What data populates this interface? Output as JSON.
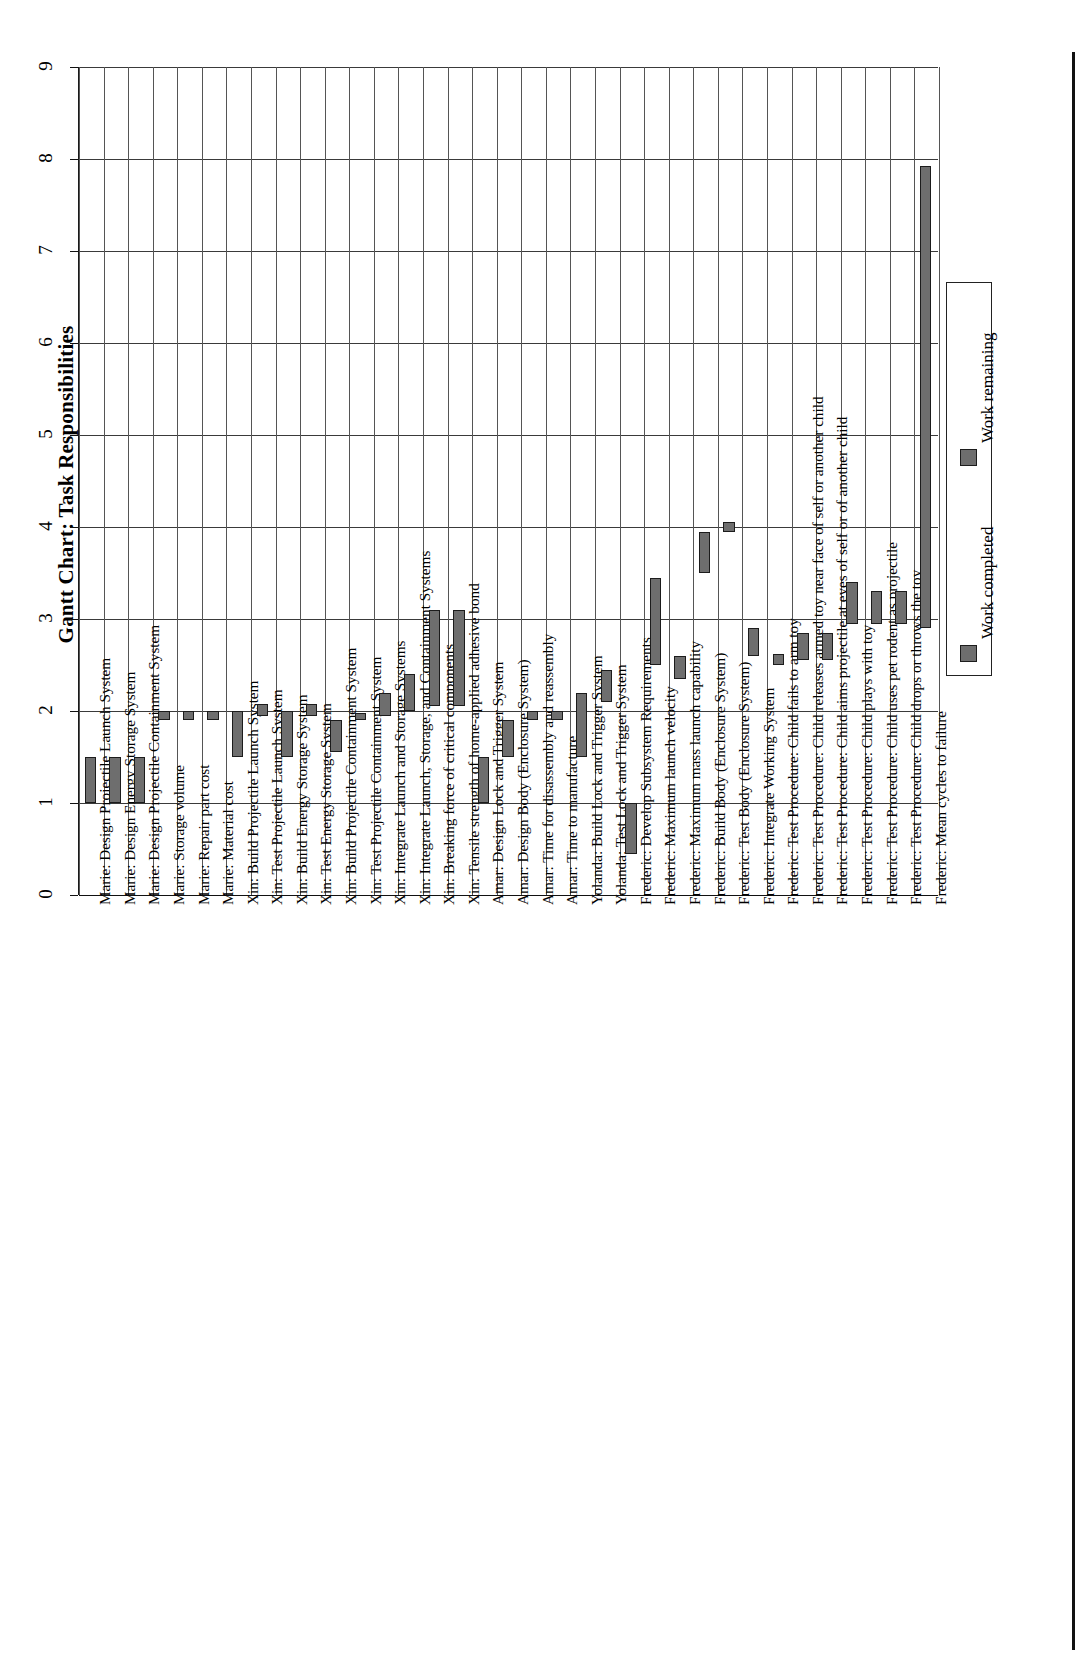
{
  "chart_data": {
    "type": "bar",
    "subtype": "gantt-floating-bar",
    "title": "Gantt Chart: Task Responsibilities",
    "xlabel": "",
    "ylabel": "",
    "ylim": [
      0,
      9
    ],
    "yticks": [
      0,
      1,
      2,
      3,
      4,
      5,
      6,
      7,
      8,
      9
    ],
    "grid": true,
    "orientation": "rotated-90",
    "legend": {
      "position": "right",
      "entries": [
        {
          "label": "Work completed",
          "color": "#6e6e6e"
        },
        {
          "label": "Work remaining",
          "color": "#6e6e6e"
        }
      ]
    },
    "categories": [
      "Marie: Design Projectile Launch System",
      "Marie: Design Energy Storage System",
      "Marie: Design Projectile Containment System",
      "Marie: Storage volume",
      "Marie: Repair part cost",
      "Marie: Material cost",
      "Xin: Build Projectile Launch System",
      "Xin: Test Projectile Launch System",
      "Xin: Build Energy Storage System",
      "Xin: Test Energy Storage System",
      "Xin: Build Projectile Containment System",
      "Xin: Test Projectile Containment System",
      "Xin: Integrate Launch and Storage Systems",
      "Xin: Integrate Launch, Storage, and Containment Systems",
      "Xin: Breaking force of critical components",
      "Xin: Tensile strength of home-applied adhesive bond",
      "Amar: Design Lock and Trigger System",
      "Amar: Design Body (Enclosure System)",
      "Amar: Time for disassembly and reassembly",
      "Amar: Time to manufacture",
      "Yolanda: Build Lock and Trigger System",
      "Yolanda: Test Lock and Trigger System",
      "Frederic: Develop Subsystem Requirements",
      "Frederic: Maximum launch velocity",
      "Frederic: Maximum mass launch capability",
      "Frederic: Build Body (Enclosure System)",
      "Frederic: Test Body (Enclosure System)",
      "Frederic: Integrate Working System",
      "Frederic: Test Procedure: Child fails to arm toy",
      "Frederic: Test Procedure: Child releases armed toy near face of self or another child",
      "Frederic: Test Procedure: Child aims projectile at eyes of self or of another child",
      "Frederic: Test Procedure: Child plays with toy",
      "Frederic: Test Procedure: Child uses pet rodent as projectile",
      "Frederic: Test Procedure: Child drops or throws the toy",
      "Frederic: Mean cycles to failure"
    ],
    "bars": [
      {
        "category": "Marie: Design Projectile Launch System",
        "start": 1.0,
        "end": 1.5
      },
      {
        "category": "Marie: Design Energy Storage System",
        "start": 1.0,
        "end": 1.5
      },
      {
        "category": "Marie: Design Projectile Containment System",
        "start": 1.0,
        "end": 1.5
      },
      {
        "category": "Marie: Storage volume",
        "start": 1.9,
        "end": 2.0
      },
      {
        "category": "Marie: Repair part cost",
        "start": 1.9,
        "end": 2.0
      },
      {
        "category": "Marie: Material cost",
        "start": 1.9,
        "end": 2.0
      },
      {
        "category": "Xin: Build Projectile Launch System",
        "start": 1.5,
        "end": 2.0
      },
      {
        "category": "Xin: Test Projectile Launch System",
        "start": 1.95,
        "end": 2.08
      },
      {
        "category": "Xin: Build Energy Storage System",
        "start": 1.5,
        "end": 2.0
      },
      {
        "category": "Xin: Test Energy Storage System",
        "start": 1.95,
        "end": 2.08
      },
      {
        "category": "Xin: Build Projectile Containment System",
        "start": 1.55,
        "end": 1.9
      },
      {
        "category": "Xin: Test Projectile Containment System",
        "start": 1.9,
        "end": 1.98
      },
      {
        "category": "Xin: Integrate Launch and Storage Systems",
        "start": 1.95,
        "end": 2.2
      },
      {
        "category": "Xin: Integrate Launch, Storage, and Containment Systems",
        "start": 2.0,
        "end": 2.4
      },
      {
        "category": "Xin: Breaking force of critical components",
        "start": 2.05,
        "end": 3.1
      },
      {
        "category": "Xin: Tensile strength of home-applied adhesive bond",
        "start": 2.05,
        "end": 3.1
      },
      {
        "category": "Amar: Design Lock and Trigger System",
        "start": 1.0,
        "end": 1.5
      },
      {
        "category": "Amar: Design Body (Enclosure System)",
        "start": 1.5,
        "end": 1.9
      },
      {
        "category": "Amar: Time for disassembly and reassembly",
        "start": 1.9,
        "end": 2.0
      },
      {
        "category": "Amar: Time to manufacture",
        "start": 1.9,
        "end": 2.0
      },
      {
        "category": "Yolanda: Build Lock and Trigger System",
        "start": 1.5,
        "end": 2.2
      },
      {
        "category": "Yolanda: Test Lock and Trigger System",
        "start": 2.1,
        "end": 2.45
      },
      {
        "category": "Frederic: Develop Subsystem Requirements",
        "start": 0.45,
        "end": 1.0
      },
      {
        "category": "Frederic: Maximum launch velocity",
        "start": 2.5,
        "end": 3.45
      },
      {
        "category": "Frederic: Maximum mass launch capability",
        "start": 2.35,
        "end": 2.6
      },
      {
        "category": "Frederic: Build Body (Enclosure System)",
        "start": 3.5,
        "end": 3.95
      },
      {
        "category": "Frederic: Test Body (Enclosure System)",
        "start": 3.95,
        "end": 4.05
      },
      {
        "category": "Frederic: Integrate Working System",
        "start": 2.6,
        "end": 2.9
      },
      {
        "category": "Frederic: Test Procedure: Child fails to arm toy",
        "start": 2.5,
        "end": 2.62
      },
      {
        "category": "Frederic: Test Procedure: Child releases armed toy near face of self or another child",
        "start": 2.55,
        "end": 2.85
      },
      {
        "category": "Frederic: Test Procedure: Child aims projectile at eyes of self or of another child",
        "start": 2.55,
        "end": 2.85
      },
      {
        "category": "Frederic: Test Procedure: Child plays with toy",
        "start": 2.95,
        "end": 3.4
      },
      {
        "category": "Frederic: Test Procedure: Child uses pet rodent as projectile",
        "start": 2.95,
        "end": 3.3
      },
      {
        "category": "Frederic: Test Procedure: Child drops or throws the toy",
        "start": 2.95,
        "end": 3.3
      },
      {
        "category": "Frederic: Mean cycles to failure",
        "start": 2.9,
        "end": 7.92
      }
    ]
  }
}
